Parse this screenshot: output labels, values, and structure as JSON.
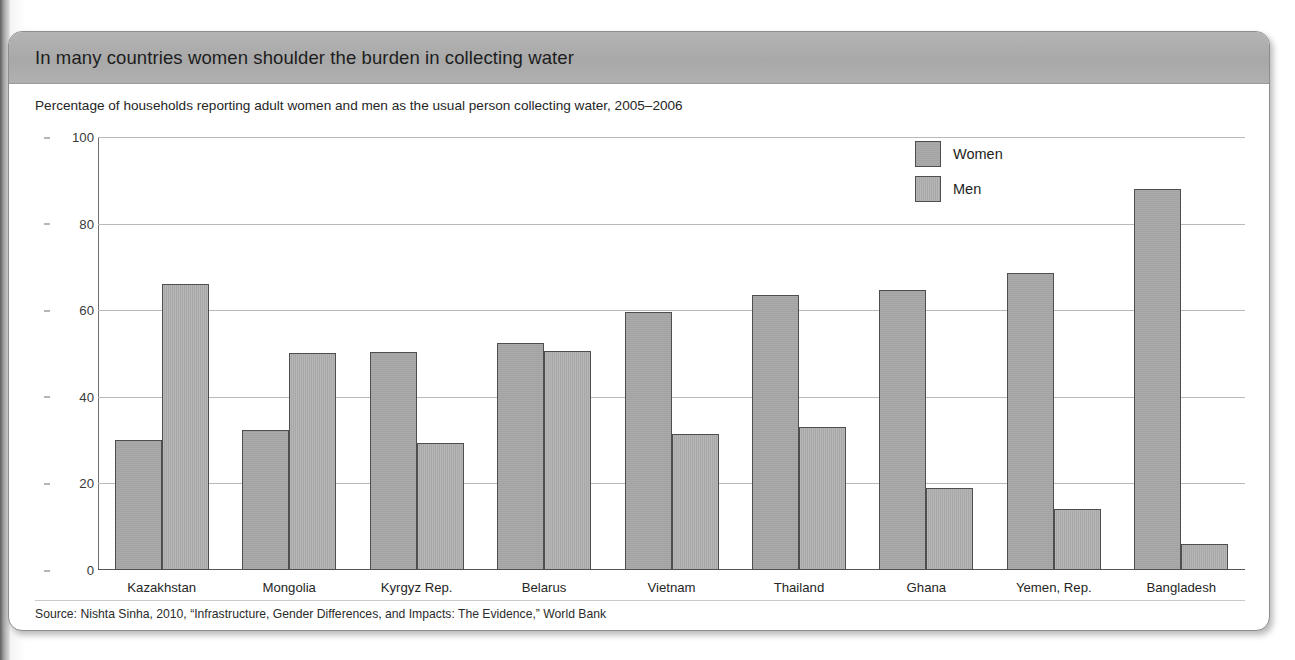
{
  "card": {
    "title": "In many countries women shoulder the burden in collecting water",
    "subtitle": "Percentage of households reporting adult women and men as the usual person collecting water, 2005–2006",
    "source": "Source: Nishta Sinha, 2010, “Infrastructure, Gender Differences, and Impacts: The Evidence,” World Bank"
  },
  "legend": {
    "position": "top-right",
    "items": [
      {
        "label": "Women",
        "color": "#a2a2a2"
      },
      {
        "label": "Men",
        "color": "#a8a8a8"
      }
    ]
  },
  "chart_data": {
    "type": "bar",
    "title": "In many countries women shoulder the burden in collecting water",
    "subtitle": "Percentage of households reporting adult women and men as the usual person collecting water, 2005–2006",
    "xlabel": "",
    "ylabel": "",
    "ylim": [
      0,
      100
    ],
    "yticks": [
      0,
      20,
      40,
      60,
      80,
      100
    ],
    "grid": true,
    "legend_position": "top-right",
    "categories": [
      "Kazakhstan",
      "Mongolia",
      "Kyrgyz Rep.",
      "Belarus",
      "Vietnam",
      "Thailand",
      "Ghana",
      "Yemen, Rep.",
      "Bangladesh"
    ],
    "series": [
      {
        "name": "Women",
        "color": "#a2a2a2",
        "values": [
          30,
          32.3,
          50.3,
          52.5,
          59.5,
          63.5,
          64.7,
          68.7,
          88
        ]
      },
      {
        "name": "Men",
        "color": "#a8a8a8",
        "values": [
          66,
          50.2,
          29.3,
          50.5,
          31.5,
          33,
          19,
          14,
          6
        ]
      }
    ]
  }
}
